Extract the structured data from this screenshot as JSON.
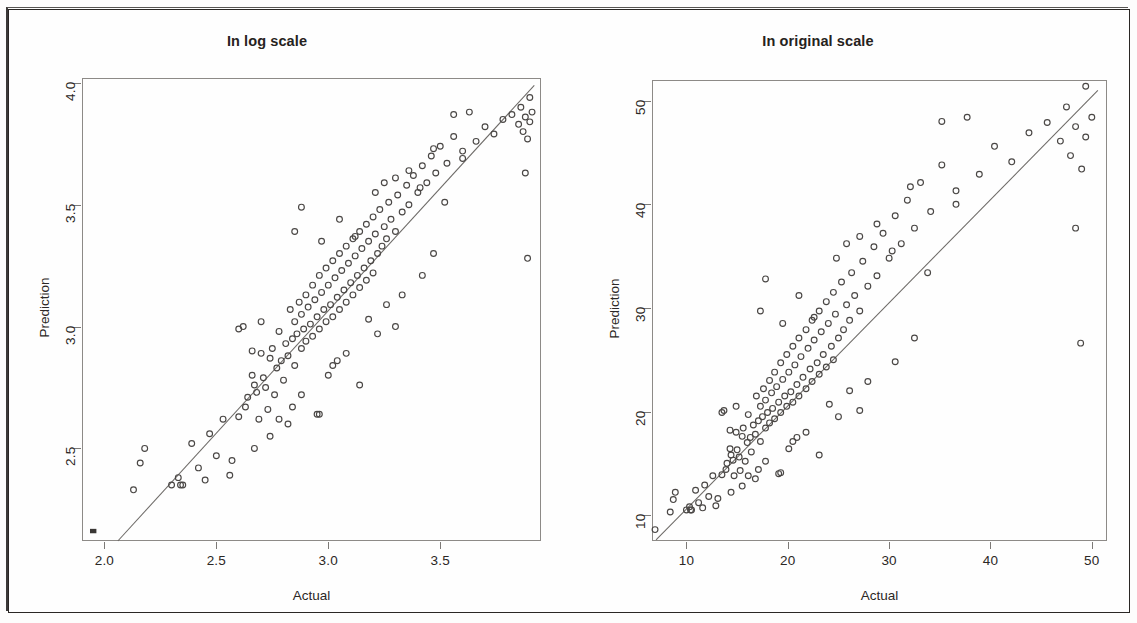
{
  "figure": {
    "axis_label_x": "Actual",
    "axis_label_y": "Prediction",
    "line_color": "#6d6a67",
    "point_color": "#4a4745",
    "frame_color": "#8d8a87"
  },
  "chart_data": [
    {
      "type": "scatter",
      "title": "In log scale",
      "xlabel": "Actual",
      "ylabel": "Prediction",
      "xlim": [
        1.9,
        3.95
      ],
      "ylim": [
        2.12,
        4.02
      ],
      "xticks": [
        "2.0",
        "2.5",
        "3.0",
        "3.5"
      ],
      "xtick_values": [
        2.0,
        2.5,
        3.0,
        3.5
      ],
      "yticks": [
        "2.5",
        "3.0",
        "3.5",
        "4.0"
      ],
      "ytick_values": [
        2.5,
        3.0,
        3.5,
        4.0
      ],
      "grid": false,
      "legend": "none",
      "reference_line": {
        "type": "identity",
        "x0": 2.06,
        "y0": 2.12,
        "x1": 3.92,
        "y1": 3.99
      },
      "marker": "open-circle",
      "n_points": 168,
      "points": [
        [
          1.95,
          2.16
        ],
        [
          2.13,
          2.33
        ],
        [
          2.16,
          2.44
        ],
        [
          2.18,
          2.5
        ],
        [
          2.33,
          2.38
        ],
        [
          2.34,
          2.35
        ],
        [
          2.35,
          2.35
        ],
        [
          2.39,
          2.52
        ],
        [
          2.42,
          2.42
        ],
        [
          2.47,
          2.56
        ],
        [
          2.5,
          2.47
        ],
        [
          2.53,
          2.62
        ],
        [
          2.57,
          2.45
        ],
        [
          2.6,
          2.99
        ],
        [
          2.63,
          2.67
        ],
        [
          2.64,
          2.71
        ],
        [
          2.66,
          2.9
        ],
        [
          2.66,
          2.8
        ],
        [
          2.67,
          2.76
        ],
        [
          2.68,
          2.73
        ],
        [
          2.69,
          2.62
        ],
        [
          2.7,
          2.89
        ],
        [
          2.71,
          2.79
        ],
        [
          2.72,
          2.75
        ],
        [
          2.73,
          2.66
        ],
        [
          2.74,
          2.87
        ],
        [
          2.75,
          2.91
        ],
        [
          2.76,
          2.72
        ],
        [
          2.77,
          2.83
        ],
        [
          2.78,
          2.98
        ],
        [
          2.79,
          2.86
        ],
        [
          2.8,
          2.78
        ],
        [
          2.81,
          2.93
        ],
        [
          2.82,
          2.88
        ],
        [
          2.83,
          3.07
        ],
        [
          2.84,
          2.95
        ],
        [
          2.85,
          2.84
        ],
        [
          2.85,
          3.02
        ],
        [
          2.86,
          2.97
        ],
        [
          2.87,
          3.1
        ],
        [
          2.88,
          2.91
        ],
        [
          2.88,
          3.05
        ],
        [
          2.89,
          2.99
        ],
        [
          2.9,
          3.13
        ],
        [
          2.9,
          2.94
        ],
        [
          2.91,
          3.08
        ],
        [
          2.92,
          3.01
        ],
        [
          2.93,
          3.17
        ],
        [
          2.93,
          2.96
        ],
        [
          2.94,
          3.11
        ],
        [
          2.95,
          3.04
        ],
        [
          2.96,
          3.21
        ],
        [
          2.96,
          2.99
        ],
        [
          2.97,
          3.14
        ],
        [
          2.98,
          3.07
        ],
        [
          2.99,
          3.24
        ],
        [
          2.99,
          3.02
        ],
        [
          3.0,
          3.17
        ],
        [
          3.01,
          3.09
        ],
        [
          3.02,
          3.27
        ],
        [
          3.02,
          3.04
        ],
        [
          3.03,
          3.2
        ],
        [
          3.04,
          3.12
        ],
        [
          3.05,
          3.3
        ],
        [
          3.05,
          3.07
        ],
        [
          3.06,
          3.23
        ],
        [
          3.07,
          3.15
        ],
        [
          3.08,
          3.33
        ],
        [
          3.08,
          3.1
        ],
        [
          3.09,
          3.26
        ],
        [
          3.1,
          3.18
        ],
        [
          3.11,
          3.36
        ],
        [
          3.11,
          3.13
        ],
        [
          3.12,
          3.29
        ],
        [
          3.13,
          3.21
        ],
        [
          3.14,
          3.39
        ],
        [
          3.14,
          3.16
        ],
        [
          3.15,
          3.32
        ],
        [
          3.16,
          3.24
        ],
        [
          3.17,
          3.42
        ],
        [
          3.17,
          3.19
        ],
        [
          3.18,
          3.35
        ],
        [
          3.19,
          3.27
        ],
        [
          3.2,
          3.45
        ],
        [
          3.2,
          3.22
        ],
        [
          3.21,
          3.38
        ],
        [
          3.22,
          3.3
        ],
        [
          3.23,
          3.48
        ],
        [
          3.24,
          3.33
        ],
        [
          3.25,
          3.41
        ],
        [
          3.26,
          3.36
        ],
        [
          3.27,
          3.51
        ],
        [
          3.28,
          3.44
        ],
        [
          3.3,
          3.39
        ],
        [
          3.31,
          3.54
        ],
        [
          3.33,
          3.47
        ],
        [
          3.35,
          3.58
        ],
        [
          3.36,
          3.5
        ],
        [
          3.38,
          3.62
        ],
        [
          3.4,
          3.55
        ],
        [
          3.42,
          3.66
        ],
        [
          3.44,
          3.59
        ],
        [
          3.46,
          3.7
        ],
        [
          3.48,
          3.63
        ],
        [
          3.5,
          3.74
        ],
        [
          3.53,
          3.67
        ],
        [
          3.56,
          3.78
        ],
        [
          3.6,
          3.72
        ],
        [
          3.63,
          3.88
        ],
        [
          3.66,
          3.76
        ],
        [
          3.7,
          3.82
        ],
        [
          3.74,
          3.79
        ],
        [
          3.78,
          3.85
        ],
        [
          3.82,
          3.87
        ],
        [
          3.85,
          3.83
        ],
        [
          3.86,
          3.9
        ],
        [
          3.87,
          3.8
        ],
        [
          3.88,
          3.86
        ],
        [
          3.89,
          3.77
        ],
        [
          3.9,
          3.94
        ],
        [
          3.9,
          3.84
        ],
        [
          3.91,
          3.88
        ],
        [
          3.88,
          3.63
        ],
        [
          3.89,
          3.28
        ],
        [
          2.62,
          3.0
        ],
        [
          2.7,
          3.02
        ],
        [
          2.88,
          3.49
        ],
        [
          2.85,
          3.39
        ],
        [
          3.05,
          3.44
        ],
        [
          3.12,
          3.37
        ],
        [
          2.97,
          3.35
        ],
        [
          3.21,
          3.55
        ],
        [
          3.25,
          3.59
        ],
        [
          3.3,
          3.61
        ],
        [
          3.36,
          3.64
        ],
        [
          3.41,
          3.57
        ],
        [
          3.47,
          3.73
        ],
        [
          3.52,
          3.51
        ],
        [
          3.56,
          3.87
        ],
        [
          3.6,
          3.69
        ],
        [
          3.14,
          2.76
        ],
        [
          3.02,
          2.84
        ],
        [
          3.08,
          2.89
        ],
        [
          2.95,
          2.64
        ],
        [
          2.96,
          2.64
        ],
        [
          2.88,
          2.72
        ],
        [
          2.84,
          2.67
        ],
        [
          3.18,
          3.03
        ],
        [
          3.26,
          3.09
        ],
        [
          3.33,
          3.13
        ],
        [
          2.74,
          2.55
        ],
        [
          2.67,
          2.5
        ],
        [
          2.56,
          2.39
        ],
        [
          2.45,
          2.37
        ],
        [
          2.3,
          2.35
        ],
        [
          2.6,
          2.63
        ],
        [
          3.22,
          2.97
        ],
        [
          3.3,
          3.0
        ],
        [
          3.42,
          3.21
        ],
        [
          3.47,
          3.3
        ],
        [
          2.78,
          2.62
        ],
        [
          2.82,
          2.6
        ],
        [
          3.0,
          2.8
        ],
        [
          3.04,
          2.86
        ]
      ]
    },
    {
      "type": "scatter",
      "title": "In original scale",
      "xlabel": "Actual",
      "ylabel": "Prediction",
      "xlim": [
        6.6,
        51.5
      ],
      "ylim": [
        7.5,
        52.0
      ],
      "xticks": [
        "10",
        "20",
        "30",
        "40",
        "50"
      ],
      "xtick_values": [
        10,
        20,
        30,
        40,
        50
      ],
      "yticks": [
        "10",
        "20",
        "30",
        "40",
        "50"
      ],
      "ytick_values": [
        10,
        20,
        30,
        40,
        50
      ],
      "grid": false,
      "legend": "none",
      "reference_line": {
        "type": "identity",
        "x0": 7.0,
        "y0": 7.6,
        "x1": 50.6,
        "y1": 51.0
      },
      "marker": "open-circle",
      "n_points": 168,
      "points": [
        [
          6.9,
          8.6
        ],
        [
          8.4,
          10.3
        ],
        [
          8.7,
          11.5
        ],
        [
          8.9,
          12.2
        ],
        [
          10.3,
          10.8
        ],
        [
          10.4,
          10.5
        ],
        [
          10.5,
          10.5
        ],
        [
          10.9,
          12.4
        ],
        [
          11.2,
          11.2
        ],
        [
          11.8,
          12.9
        ],
        [
          12.2,
          11.8
        ],
        [
          12.6,
          13.8
        ],
        [
          13.1,
          11.6
        ],
        [
          13.5,
          19.9
        ],
        [
          13.9,
          14.4
        ],
        [
          14.0,
          15.0
        ],
        [
          14.3,
          18.2
        ],
        [
          14.3,
          16.4
        ],
        [
          14.4,
          15.8
        ],
        [
          14.6,
          15.3
        ],
        [
          14.7,
          13.8
        ],
        [
          14.9,
          18.0
        ],
        [
          15.0,
          16.3
        ],
        [
          15.2,
          15.6
        ],
        [
          15.3,
          14.3
        ],
        [
          15.5,
          17.6
        ],
        [
          15.6,
          18.4
        ],
        [
          15.8,
          15.2
        ],
        [
          16.0,
          17.0
        ],
        [
          16.1,
          19.7
        ],
        [
          16.3,
          17.5
        ],
        [
          16.4,
          16.1
        ],
        [
          16.6,
          18.7
        ],
        [
          16.8,
          17.8
        ],
        [
          16.9,
          21.5
        ],
        [
          17.1,
          19.1
        ],
        [
          17.3,
          17.1
        ],
        [
          17.3,
          20.5
        ],
        [
          17.5,
          19.5
        ],
        [
          17.6,
          22.2
        ],
        [
          17.8,
          18.4
        ],
        [
          17.8,
          21.1
        ],
        [
          18.0,
          19.9
        ],
        [
          18.2,
          23.0
        ],
        [
          18.2,
          18.9
        ],
        [
          18.4,
          21.8
        ],
        [
          18.5,
          20.3
        ],
        [
          18.7,
          23.8
        ],
        [
          18.7,
          19.3
        ],
        [
          18.9,
          22.4
        ],
        [
          19.1,
          20.9
        ],
        [
          19.3,
          24.7
        ],
        [
          19.3,
          19.9
        ],
        [
          19.5,
          23.1
        ],
        [
          19.7,
          21.5
        ],
        [
          19.9,
          25.5
        ],
        [
          19.9,
          20.5
        ],
        [
          20.1,
          23.8
        ],
        [
          20.3,
          21.9
        ],
        [
          20.5,
          26.3
        ],
        [
          20.5,
          20.9
        ],
        [
          20.7,
          24.5
        ],
        [
          20.9,
          22.6
        ],
        [
          21.1,
          27.1
        ],
        [
          21.1,
          21.5
        ],
        [
          21.3,
          25.3
        ],
        [
          21.5,
          23.3
        ],
        [
          21.8,
          27.9
        ],
        [
          21.8,
          22.2
        ],
        [
          22.0,
          26.1
        ],
        [
          22.2,
          24.1
        ],
        [
          22.4,
          28.8
        ],
        [
          22.4,
          22.9
        ],
        [
          22.6,
          26.9
        ],
        [
          22.9,
          24.7
        ],
        [
          23.1,
          29.7
        ],
        [
          23.1,
          23.6
        ],
        [
          23.3,
          27.7
        ],
        [
          23.5,
          25.5
        ],
        [
          23.8,
          30.6
        ],
        [
          23.8,
          24.3
        ],
        [
          24.0,
          28.5
        ],
        [
          24.3,
          26.3
        ],
        [
          24.5,
          31.5
        ],
        [
          24.5,
          25.0
        ],
        [
          24.7,
          29.4
        ],
        [
          25.0,
          27.1
        ],
        [
          25.3,
          32.5
        ],
        [
          25.5,
          27.9
        ],
        [
          25.8,
          30.3
        ],
        [
          26.1,
          28.8
        ],
        [
          26.3,
          33.4
        ],
        [
          26.6,
          31.2
        ],
        [
          27.1,
          29.7
        ],
        [
          27.4,
          34.5
        ],
        [
          27.9,
          32.1
        ],
        [
          28.5,
          35.9
        ],
        [
          28.8,
          33.1
        ],
        [
          29.4,
          37.2
        ],
        [
          30.0,
          34.8
        ],
        [
          30.6,
          38.9
        ],
        [
          31.2,
          36.2
        ],
        [
          31.8,
          40.4
        ],
        [
          32.5,
          37.7
        ],
        [
          33.1,
          42.1
        ],
        [
          34.1,
          39.3
        ],
        [
          35.2,
          43.8
        ],
        [
          36.6,
          41.3
        ],
        [
          37.7,
          48.4
        ],
        [
          38.9,
          42.9
        ],
        [
          40.4,
          45.6
        ],
        [
          42.1,
          44.1
        ],
        [
          43.8,
          46.9
        ],
        [
          45.6,
          47.9
        ],
        [
          46.9,
          46.1
        ],
        [
          47.5,
          49.4
        ],
        [
          47.9,
          44.7
        ],
        [
          48.4,
          47.5
        ],
        [
          49.0,
          43.4
        ],
        [
          49.4,
          51.4
        ],
        [
          49.4,
          46.5
        ],
        [
          50.0,
          48.4
        ],
        [
          48.4,
          37.7
        ],
        [
          48.9,
          26.6
        ],
        [
          13.7,
          20.1
        ],
        [
          14.9,
          20.5
        ],
        [
          17.8,
          32.8
        ],
        [
          17.3,
          29.7
        ],
        [
          21.1,
          31.2
        ],
        [
          22.6,
          29.1
        ],
        [
          19.5,
          28.5
        ],
        [
          24.8,
          34.8
        ],
        [
          25.8,
          36.2
        ],
        [
          27.1,
          36.9
        ],
        [
          28.8,
          38.1
        ],
        [
          30.3,
          35.5
        ],
        [
          32.1,
          41.7
        ],
        [
          33.8,
          33.4
        ],
        [
          35.2,
          48.0
        ],
        [
          36.6,
          40.0
        ],
        [
          23.1,
          15.8
        ],
        [
          20.5,
          17.1
        ],
        [
          21.8,
          18.0
        ],
        [
          19.1,
          14.0
        ],
        [
          19.3,
          14.1
        ],
        [
          17.8,
          15.2
        ],
        [
          17.1,
          14.4
        ],
        [
          24.1,
          20.7
        ],
        [
          26.1,
          22.0
        ],
        [
          27.9,
          22.9
        ],
        [
          15.5,
          12.8
        ],
        [
          14.4,
          12.2
        ],
        [
          12.9,
          10.9
        ],
        [
          11.6,
          10.7
        ],
        [
          10.0,
          10.5
        ],
        [
          13.5,
          13.9
        ],
        [
          25.0,
          19.5
        ],
        [
          27.1,
          20.1
        ],
        [
          30.6,
          24.8
        ],
        [
          32.5,
          27.1
        ],
        [
          16.1,
          13.8
        ],
        [
          16.8,
          13.5
        ],
        [
          20.1,
          16.4
        ],
        [
          20.9,
          17.5
        ]
      ]
    }
  ]
}
